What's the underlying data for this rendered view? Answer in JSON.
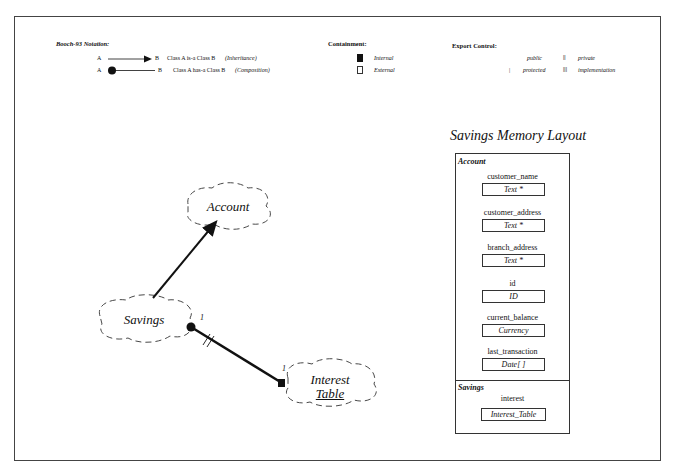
{
  "legend": {
    "notation": {
      "title": "Booch-93 Notation:",
      "rows": [
        {
          "from": "A",
          "to": "B",
          "text": "Class A  is-a  Class B",
          "kind": "(Inheritance)",
          "icon": "arrow-inheritance-icon"
        },
        {
          "from": "A",
          "to": "B",
          "text": "Class A  has-a  Class B",
          "kind": "(Composition)",
          "icon": "dot-composition-icon"
        }
      ]
    },
    "containment": {
      "title": "Containment:",
      "items": [
        {
          "label": "Internal",
          "icon": "filled-square-icon"
        },
        {
          "label": "External",
          "icon": "hollow-square-icon"
        }
      ]
    },
    "export_control": {
      "title": "Export Control:",
      "items": [
        {
          "symbol": "",
          "label": "public"
        },
        {
          "symbol": "||",
          "label": "private"
        },
        {
          "symbol": "|",
          "label": "protected"
        },
        {
          "symbol": "|||",
          "label": "implementation"
        }
      ]
    }
  },
  "diagram": {
    "classes": [
      {
        "name": "Account"
      },
      {
        "name": "Savings"
      },
      {
        "name_line1": "Interest",
        "name_line2": "Table"
      }
    ],
    "relations": [
      {
        "type": "inheritance",
        "from": "Savings",
        "to": "Account"
      },
      {
        "type": "composition",
        "from": "Savings",
        "to": "Interest Table",
        "from_mult": "1",
        "to_mult": "1",
        "containment": "internal"
      }
    ]
  },
  "memory_layout": {
    "title": "Savings Memory Layout",
    "sections": [
      {
        "name": "Account",
        "fields": [
          {
            "name": "customer_name",
            "type": "Text *"
          },
          {
            "name": "customer_address",
            "type": "Text *"
          },
          {
            "name": "branch_address",
            "type": "Text *"
          },
          {
            "name": "id",
            "type": "ID"
          },
          {
            "name": "current_balance",
            "type": "Currency"
          },
          {
            "name": "last_transaction",
            "type": "Date[ ]"
          }
        ]
      },
      {
        "name": "Savings",
        "fields": [
          {
            "name": "interest",
            "type": "Interest_Table"
          }
        ]
      }
    ]
  }
}
